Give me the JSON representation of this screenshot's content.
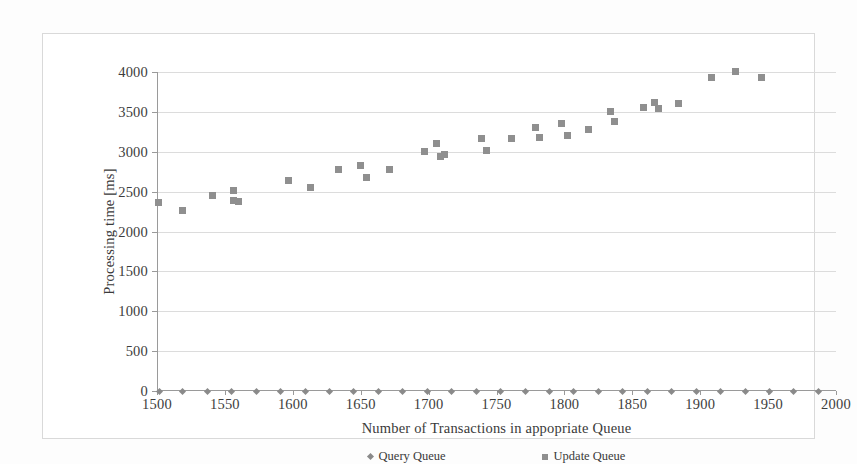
{
  "figure": {
    "background_color": "#fdfdfd",
    "frame_border_color": "#d9d9d9"
  },
  "chart_data": {
    "type": "scatter",
    "title": "",
    "xlabel": "Number of Transactions in appopriate Queue",
    "ylabel": "Processing time [ms]",
    "xlim": [
      1500,
      2000
    ],
    "ylim": [
      0,
      4000
    ],
    "xticks": [
      1500,
      1550,
      1600,
      1650,
      1700,
      1750,
      1800,
      1850,
      1900,
      1950,
      2000
    ],
    "yticks": [
      0,
      500,
      1000,
      1500,
      2000,
      2500,
      3000,
      3500,
      4000
    ],
    "xtick_labels": [
      "1500",
      "1550",
      "1600",
      "1650",
      "1700",
      "1750",
      "1800",
      "1850",
      "1900",
      "1950",
      "2000"
    ],
    "ytick_labels": [
      "0",
      "500",
      "1000",
      "1500",
      "2000",
      "2500",
      "3000",
      "3500",
      "4000"
    ],
    "grid": "horizontal",
    "legend_position": "bottom",
    "marker_color": "#8f8f8f",
    "series": [
      {
        "name": "Query Queue",
        "marker": "diamond",
        "color": "#8a8a8a",
        "points": [
          [
            1502,
            0
          ],
          [
            1519,
            0
          ],
          [
            1537,
            0
          ],
          [
            1555,
            0
          ],
          [
            1573,
            0
          ],
          [
            1591,
            0
          ],
          [
            1609,
            0
          ],
          [
            1627,
            0
          ],
          [
            1645,
            0
          ],
          [
            1663,
            0
          ],
          [
            1681,
            0
          ],
          [
            1699,
            0
          ],
          [
            1717,
            0
          ],
          [
            1735,
            0
          ],
          [
            1753,
            0
          ],
          [
            1771,
            0
          ],
          [
            1789,
            0
          ],
          [
            1807,
            0
          ],
          [
            1825,
            0
          ],
          [
            1843,
            0
          ],
          [
            1861,
            0
          ],
          [
            1879,
            0
          ],
          [
            1897,
            0
          ],
          [
            1915,
            0
          ],
          [
            1933,
            0
          ],
          [
            1951,
            0
          ],
          [
            1969,
            0
          ],
          [
            1987,
            0
          ]
        ]
      },
      {
        "name": "Update Queue",
        "marker": "square",
        "color": "#8f8f8f",
        "points": [
          [
            1501,
            2360
          ],
          [
            1519,
            2265
          ],
          [
            1541,
            2450
          ],
          [
            1556,
            2520
          ],
          [
            1556,
            2390
          ],
          [
            1560,
            2380
          ],
          [
            1597,
            2640
          ],
          [
            1613,
            2550
          ],
          [
            1634,
            2780
          ],
          [
            1650,
            2830
          ],
          [
            1654,
            2680
          ],
          [
            1671,
            2780
          ],
          [
            1697,
            3000
          ],
          [
            1706,
            3100
          ],
          [
            1709,
            2940
          ],
          [
            1712,
            2960
          ],
          [
            1739,
            3160
          ],
          [
            1743,
            3020
          ],
          [
            1761,
            3170
          ],
          [
            1779,
            3310
          ],
          [
            1782,
            3180
          ],
          [
            1798,
            3350
          ],
          [
            1802,
            3200
          ],
          [
            1818,
            3280
          ],
          [
            1834,
            3500
          ],
          [
            1837,
            3380
          ],
          [
            1858,
            3560
          ],
          [
            1866,
            3620
          ],
          [
            1869,
            3540
          ],
          [
            1884,
            3600
          ],
          [
            1908,
            3930
          ],
          [
            1926,
            4010
          ],
          [
            1945,
            3930
          ]
        ]
      }
    ]
  }
}
